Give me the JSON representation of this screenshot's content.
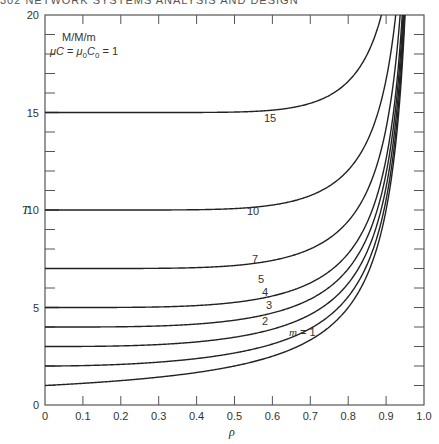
{
  "header": {
    "text": "302        NETWORK SYSTEMS ANALYSIS AND DESIGN"
  },
  "chart_data": {
    "type": "line",
    "title": "",
    "annotation": [
      "M/M/m",
      "μC = μ0C0 = 1"
    ],
    "xlabel": "ρ",
    "ylabel": "T",
    "xlim": [
      0,
      1.0
    ],
    "ylim": [
      0,
      20
    ],
    "x_ticks": [
      "0",
      "0.1",
      "0.2",
      "0.3",
      "0.4",
      "0.5",
      "0.6",
      "0.7",
      "0.8",
      "0.9",
      "1.0"
    ],
    "y_ticks": [
      "0",
      "5",
      "10",
      "15",
      "20"
    ],
    "grid": false,
    "legend": "inline curve labels",
    "x": [
      0,
      0.1,
      0.2,
      0.3,
      0.4,
      0.5,
      0.6,
      0.7,
      0.8,
      0.85,
      0.9,
      0.93,
      0.95
    ],
    "series": [
      {
        "name": "m = 1",
        "label": "m = 1",
        "m": 1,
        "values": [
          1.0,
          1.11,
          1.25,
          1.43,
          1.67,
          2.0,
          2.5,
          3.33,
          5.0,
          6.67,
          10.0,
          14.3,
          20.0
        ]
      },
      {
        "name": "2",
        "label": "2",
        "m": 2,
        "values": [
          2.0,
          2.01,
          2.04,
          2.1,
          2.19,
          2.33,
          2.56,
          2.96,
          3.78,
          4.7,
          6.26,
          8.11,
          10.3
        ]
      },
      {
        "name": "3",
        "label": "3",
        "m": 3,
        "values": [
          3.0,
          3.0,
          3.01,
          3.03,
          3.08,
          3.16,
          3.33,
          3.65,
          4.38,
          5.22,
          6.64,
          8.37,
          10.5
        ]
      },
      {
        "name": "4",
        "label": "4",
        "m": 4,
        "values": [
          4.0,
          4.0,
          4.0,
          4.01,
          4.03,
          4.09,
          4.22,
          4.5,
          5.19,
          6.0,
          7.4,
          9.1,
          11.2
        ]
      },
      {
        "name": "5",
        "label": "5",
        "m": 5,
        "values": [
          5.0,
          5.0,
          5.0,
          5.0,
          5.02,
          5.05,
          5.15,
          5.39,
          6.03,
          6.8,
          8.18,
          9.85,
          12.0
        ]
      },
      {
        "name": "7",
        "label": "7",
        "m": 7,
        "values": [
          7.0,
          7.0,
          7.0,
          7.0,
          7.0,
          7.02,
          7.08,
          7.25,
          7.77,
          8.47,
          9.75,
          11.4,
          13.5
        ]
      },
      {
        "name": "10",
        "label": "10",
        "m": 10,
        "values": [
          10.0,
          10.0,
          10.0,
          10.0,
          10.0,
          10.0,
          10.03,
          10.13,
          10.53,
          11.13,
          12.2,
          13.8,
          15.8
        ]
      },
      {
        "name": "15",
        "label": "15",
        "m": 15,
        "values": [
          15.0,
          15.0,
          15.0,
          15.0,
          15.0,
          15.0,
          15.01,
          15.06,
          15.35,
          15.83,
          16.8,
          18.3,
          20.2
        ]
      }
    ]
  }
}
